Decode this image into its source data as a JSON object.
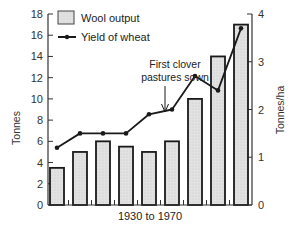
{
  "chart_data": {
    "type": "bar+line",
    "title": "",
    "xlabel": "1930 to 1970",
    "ylabel": "Tonnes",
    "y2label": "Tonnes/ha",
    "ylim": [
      0,
      18
    ],
    "y2lim": [
      0,
      4
    ],
    "yticks": [
      0,
      2,
      4,
      6,
      8,
      10,
      12,
      14,
      16,
      18
    ],
    "y2ticks": [
      0,
      1,
      2,
      3,
      4
    ],
    "grid": false,
    "legend_position": "top-left",
    "categories": [
      "1",
      "2",
      "3",
      "4",
      "5",
      "6",
      "7",
      "8",
      "9"
    ],
    "series": [
      {
        "name": "Wool output",
        "type": "bar",
        "axis": "left",
        "values": [
          3.5,
          5,
          6,
          5.5,
          5,
          6,
          10,
          14,
          17
        ]
      },
      {
        "name": "Yield of wheat",
        "type": "line",
        "axis": "right",
        "values": [
          1.2,
          1.5,
          1.5,
          1.5,
          1.9,
          2.0,
          2.7,
          2.4,
          3.7
        ]
      }
    ],
    "annotations": [
      {
        "text_line1": "First clover",
        "text_line2": "pastures sown",
        "points_to_index": 5,
        "arrow": "down"
      }
    ],
    "colors": {
      "bar_fill": "#dcdcdc",
      "bar_stroke": "#1a1a1a",
      "line": "#1a1a1a",
      "axis": "#333333"
    }
  },
  "legend": {
    "wool": "Wool output",
    "wheat": "Yield of wheat"
  },
  "annotation": {
    "line1": "First clover",
    "line2": "pastures sown"
  },
  "axes": {
    "left_title": "Tonnes",
    "right_title": "Tonnes/ha",
    "x_title": "1930 to 1970"
  }
}
